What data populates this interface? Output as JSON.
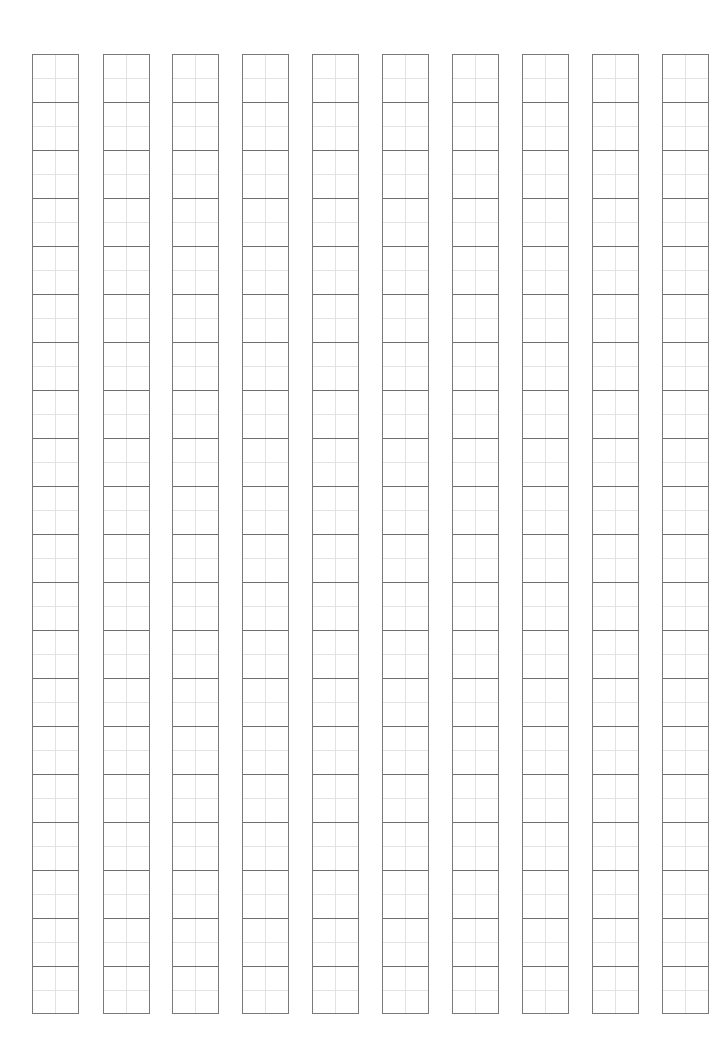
{
  "page": {
    "type": "writing-practice-grid-paper",
    "background_color": "#ffffff",
    "line_color": "#7a7a7a",
    "guide_color": "#e2e2e2"
  },
  "grid": {
    "columns": 10,
    "rows_per_column": 20,
    "cell_width_px": 47,
    "cell_height_px": 48,
    "column_pitch_px": 70,
    "top_px": 54,
    "bottom_px": 1014,
    "column_lefts_px": [
      32,
      103,
      172,
      242,
      312,
      382,
      452,
      522,
      592,
      662
    ],
    "cell_subdivision": "2x2 light guide lines"
  }
}
